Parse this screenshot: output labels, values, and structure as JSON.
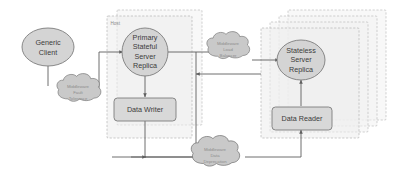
{
  "diagram": {
    "background_color": "#ffffff",
    "containers": [
      {
        "id": "host",
        "label": "Host"
      },
      {
        "id": "replica-stack",
        "label": ""
      }
    ],
    "nodes": [
      {
        "id": "generic-client",
        "label_lines": [
          "Generic",
          "Client"
        ],
        "shape": "ellipse"
      },
      {
        "id": "primary-stateful-server-replica",
        "label_lines": [
          "Primary",
          "Stateful",
          "Server",
          "Replica"
        ],
        "shape": "ellipse"
      },
      {
        "id": "stateless-server-replica",
        "label_lines": [
          "Stateless",
          "Server",
          "Replica"
        ],
        "shape": "ellipse"
      },
      {
        "id": "data-writer",
        "label_lines": [
          "Data Writer"
        ],
        "shape": "rounded-rect"
      },
      {
        "id": "data-reader",
        "label_lines": [
          "Data Reader"
        ],
        "shape": "rounded-rect"
      }
    ],
    "clouds": [
      {
        "id": "middleware-fault-tolerance",
        "label_lines": [
          "Middleware",
          "Fault",
          "Tolerance"
        ]
      },
      {
        "id": "middleware-load-balancer",
        "label_lines": [
          "Middleware",
          "Load",
          "Balancer"
        ]
      },
      {
        "id": "middleware-data-deprecation",
        "label_lines": [
          "Middleware",
          "Data",
          "Deprecation"
        ]
      }
    ],
    "colors": {
      "node_fill": "#d4d4d4",
      "node_stroke": "#7d7d7d",
      "cloud_fill": "#c9c9c9",
      "container_fill": "#ededed",
      "container_stroke": "#b4b4b4",
      "connector_stroke": "#5e5e5e",
      "text": "#3b3b3b"
    }
  }
}
